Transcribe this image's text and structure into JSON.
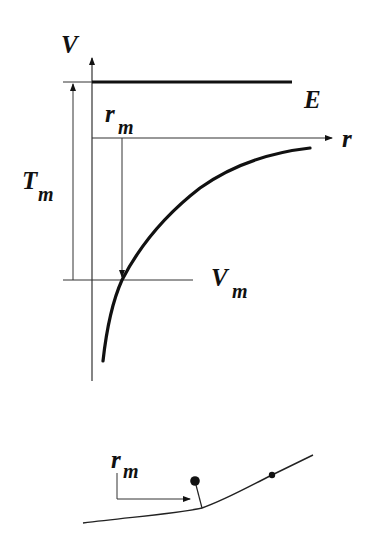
{
  "diagram": {
    "colors": {
      "ink": "#111111",
      "thin_line": "#333333",
      "background": "#ffffff"
    },
    "top_plot": {
      "axes": {
        "vertical_label": "V",
        "horizontal_label": "r"
      },
      "energy_level_label": "E",
      "closest_approach_label": {
        "main": "r",
        "sub": "m"
      },
      "kinetic_energy_label": {
        "main": "T",
        "sub": "m"
      },
      "potential_at_rm_label": {
        "main": "V",
        "sub": "m"
      }
    },
    "bottom_sketch": {
      "distance_label": {
        "main": "r",
        "sub": "m"
      },
      "elements": [
        "trajectory-curve",
        "target-ball",
        "moving-particle",
        "rm-arrow"
      ]
    }
  }
}
